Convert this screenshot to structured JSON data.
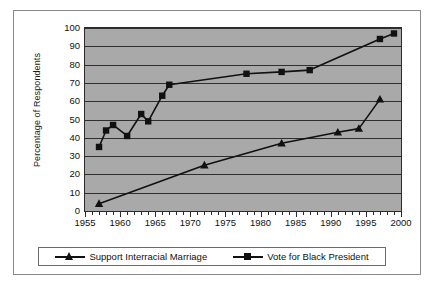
{
  "chart_data": {
    "type": "line",
    "title": "",
    "xlabel": "",
    "ylabel": "Percentage of Respondents",
    "xlim": [
      1955,
      2000
    ],
    "ylim": [
      0,
      100
    ],
    "xticks": [
      1955,
      1960,
      1965,
      1970,
      1975,
      1980,
      1985,
      1990,
      1995,
      2000
    ],
    "yticks": [
      0,
      10,
      20,
      30,
      40,
      50,
      60,
      70,
      80,
      90,
      100
    ],
    "xtick_labels": [
      "1955",
      "1960",
      "1965",
      "1970",
      "1975",
      "1980",
      "1985",
      "1990",
      "1995",
      "2000"
    ],
    "ytick_labels": [
      "0",
      "10",
      "20",
      "30",
      "40",
      "50",
      "60",
      "70",
      "80",
      "90",
      "100"
    ],
    "x_minor_tick_step": 1,
    "grid": "horizontal",
    "plot_background": "#a9a9a9",
    "legend_position": "bottom",
    "series": [
      {
        "name": "Support Interracial Marriage",
        "marker": "triangle",
        "color": "#111111",
        "points": [
          {
            "x": 1957,
            "y": 4
          },
          {
            "x": 1972,
            "y": 25
          },
          {
            "x": 1983,
            "y": 37
          },
          {
            "x": 1991,
            "y": 43
          },
          {
            "x": 1994,
            "y": 45
          },
          {
            "x": 1997,
            "y": 61
          }
        ]
      },
      {
        "name": "Vote for Black President",
        "marker": "square",
        "color": "#111111",
        "points": [
          {
            "x": 1957,
            "y": 35
          },
          {
            "x": 1958,
            "y": 44
          },
          {
            "x": 1959,
            "y": 47
          },
          {
            "x": 1961,
            "y": 41
          },
          {
            "x": 1963,
            "y": 53
          },
          {
            "x": 1964,
            "y": 49
          },
          {
            "x": 1966,
            "y": 63
          },
          {
            "x": 1967,
            "y": 69
          },
          {
            "x": 1978,
            "y": 75
          },
          {
            "x": 1983,
            "y": 76
          },
          {
            "x": 1987,
            "y": 77
          },
          {
            "x": 1997,
            "y": 94
          },
          {
            "x": 1999,
            "y": 97
          }
        ]
      }
    ]
  },
  "legend": {
    "entries": [
      {
        "label": "Support Interracial Marriage",
        "marker": "triangle"
      },
      {
        "label": "Vote for Black President",
        "marker": "square"
      }
    ]
  }
}
